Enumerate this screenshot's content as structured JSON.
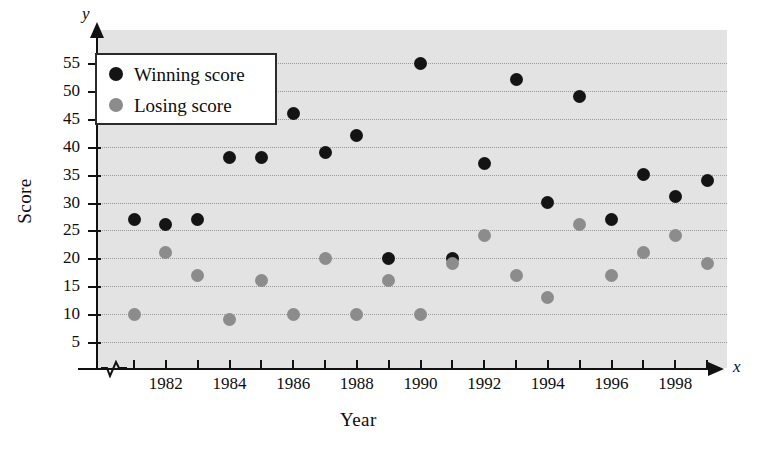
{
  "chart_data": {
    "type": "scatter",
    "title": "",
    "xlabel": "Year",
    "ylabel": "Score",
    "x_axis_variable": "x",
    "y_axis_variable": "y",
    "grid": true,
    "legend_position": "top-left",
    "x_axis_break": true,
    "xlim": [
      1980.5,
      1999.5
    ],
    "ylim": [
      0,
      57
    ],
    "x_tick_labels": [
      "1982",
      "1984",
      "1986",
      "1988",
      "1990",
      "1992",
      "1994",
      "1996",
      "1998"
    ],
    "x_ticks_all": [
      1981,
      1982,
      1983,
      1984,
      1985,
      1986,
      1987,
      1988,
      1989,
      1990,
      1991,
      1992,
      1993,
      1994,
      1995,
      1996,
      1997,
      1998,
      1999
    ],
    "y_ticks": [
      5,
      10,
      15,
      20,
      25,
      30,
      35,
      40,
      45,
      50,
      55
    ],
    "categories": [
      1981,
      1982,
      1983,
      1984,
      1985,
      1986,
      1987,
      1988,
      1989,
      1990,
      1991,
      1992,
      1993,
      1994,
      1995,
      1996,
      1997,
      1998,
      1999
    ],
    "series": [
      {
        "name": "Winning score",
        "color": "#141414",
        "values": [
          27,
          26,
          27,
          38,
          38,
          46,
          39,
          42,
          20,
          55,
          20,
          37,
          52,
          30,
          49,
          27,
          35,
          31,
          34
        ]
      },
      {
        "name": "Losing score",
        "color": "#8c8c8c",
        "values": [
          10,
          21,
          17,
          9,
          16,
          10,
          20,
          10,
          16,
          10,
          19,
          24,
          17,
          13,
          26,
          17,
          21,
          24,
          19
        ]
      }
    ]
  },
  "legend": {
    "items": [
      {
        "label": "Winning score",
        "color": "#141414"
      },
      {
        "label": "Losing score",
        "color": "#8c8c8c"
      }
    ]
  },
  "axes": {
    "y_title": "Score",
    "x_title": "Year",
    "y_var": "y",
    "x_var": "x"
  }
}
